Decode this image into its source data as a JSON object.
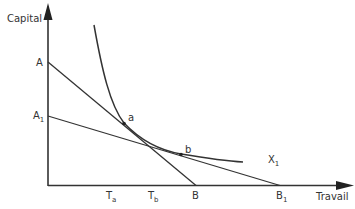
{
  "diagram": {
    "type": "isoquant-isocost",
    "axes": {
      "y_label": "Capital",
      "x_label": "Travail"
    },
    "points": {
      "A": "A",
      "A1": {
        "base": "A",
        "sub": "1"
      },
      "B": "B",
      "B1": {
        "base": "B",
        "sub": "1"
      },
      "Ta": {
        "base": "T",
        "sub": "a"
      },
      "Tb": {
        "base": "T",
        "sub": "b"
      },
      "a": "a",
      "b": "b"
    },
    "curve_label": {
      "base": "X",
      "sub": "1"
    },
    "lines": [
      {
        "name": "isocost-AB",
        "from": "A",
        "to": "B"
      },
      {
        "name": "isocost-A1B1",
        "from": "A1",
        "to": "B1"
      }
    ],
    "colors": {
      "stroke": "#333333",
      "background": "#ffffff"
    }
  }
}
